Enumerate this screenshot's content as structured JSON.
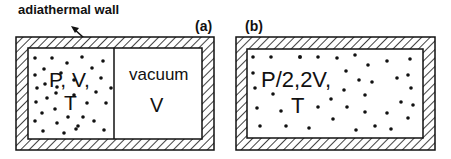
{
  "title_label": "adiathermal wall",
  "panel_a": {
    "tag": "(a)",
    "left_state_line1": "P, V,",
    "left_state_line2": "T",
    "right_label": "vacuum",
    "right_volume": "V"
  },
  "panel_b": {
    "tag": "(b)",
    "state_line1": "P/2,2V,",
    "state_line2": "T"
  },
  "colors": {
    "stroke": "#111111",
    "background": "#ffffff"
  }
}
